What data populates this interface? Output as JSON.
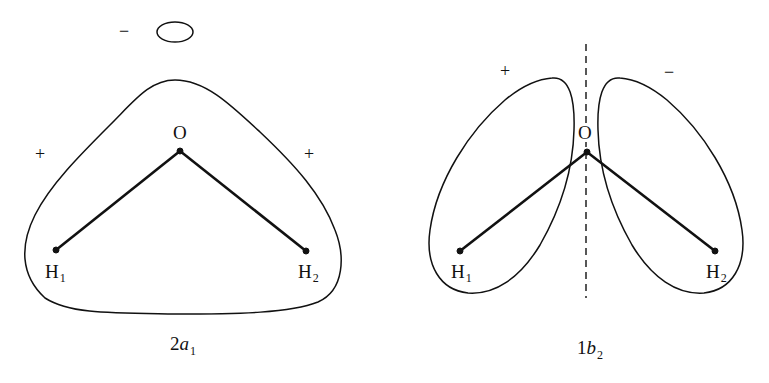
{
  "figure": {
    "panels": [
      {
        "id": "2a1",
        "caption": {
          "prefix": "2",
          "symbol": "a",
          "subscript": "1"
        },
        "atoms": {
          "oxygen": "O",
          "h1": {
            "symbol": "H",
            "subscript": "1"
          },
          "h2": {
            "symbol": "H",
            "subscript": "2"
          }
        },
        "signs": {
          "top_small_lobe": "−",
          "left": "+",
          "right": "+"
        }
      },
      {
        "id": "1b2",
        "caption": {
          "prefix": "1",
          "symbol": "b",
          "subscript": "2"
        },
        "atoms": {
          "oxygen": "O",
          "h1": {
            "symbol": "H",
            "subscript": "1"
          },
          "h2": {
            "symbol": "H",
            "subscript": "2"
          }
        },
        "signs": {
          "left_lobe": "+",
          "right_lobe": "−"
        },
        "nodal_plane": "dashed vertical line"
      }
    ],
    "colors": {
      "stroke": "#111111",
      "background": "#ffffff"
    }
  }
}
